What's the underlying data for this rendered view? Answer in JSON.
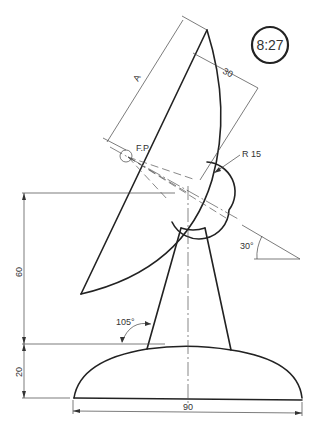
{
  "figure": {
    "id_badge": "8:27",
    "labels": {
      "dish_length": "A",
      "dish_depth": "30",
      "focal_point": "F.P.",
      "hub_radius": "R 15",
      "tilt_angle": "30°",
      "overall_height": "60",
      "base_height": "20",
      "base_width": "90",
      "stand_angle": "105°"
    },
    "colors": {
      "line": "#222222",
      "background": "#ffffff"
    }
  }
}
